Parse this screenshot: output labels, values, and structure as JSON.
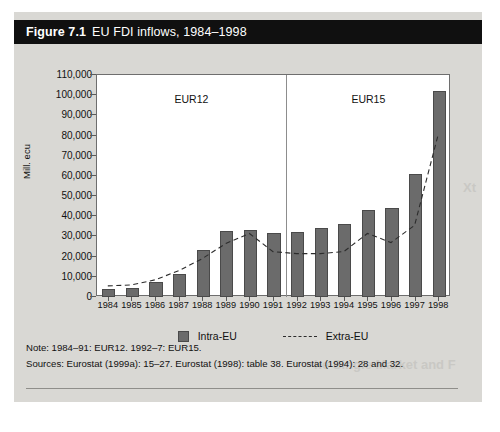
{
  "figure": {
    "number": "Figure 7.1",
    "title": "EU FDI inflows, 1984–1998"
  },
  "legend": {
    "entries": [
      {
        "label": "Intra-EU",
        "marker": "bar-swatch"
      },
      {
        "label": "Extra-EU",
        "marker": "dashed-line"
      }
    ]
  },
  "notes": {
    "note": "Note: 1984–91: EUR12. 1992–7: EUR15.",
    "sources": "Sources: Eurostat (1999a): 15–27. Eurostat (1998): table 38. Eurostat (1994): 28 and 32."
  },
  "bleed": {
    "right": "Xt",
    "heading": "he Single Market and F"
  },
  "chart_data": {
    "type": "bar",
    "title": "EU FDI inflows, 1984–1998",
    "xlabel": "",
    "ylabel": "Mill. ecu",
    "ylim": [
      0,
      110000
    ],
    "ytick_step": 10000,
    "ytick_labels": [
      "110,000",
      "100,000",
      "90,000",
      "80,000",
      "70,000",
      "60,000",
      "50,000",
      "40,000",
      "30,000",
      "20,000",
      "10,000",
      "0"
    ],
    "grid": false,
    "legend_position": "below-plot",
    "categories": [
      "1984",
      "1985",
      "1986",
      "1987",
      "1988",
      "1989",
      "1990",
      "1991",
      "1992",
      "1993",
      "1994",
      "1995",
      "1996",
      "1997",
      "1998"
    ],
    "series": [
      {
        "name": "Intra-EU",
        "type": "bar",
        "values": [
          4000,
          4500,
          7500,
          11500,
          23500,
          32500,
          33000,
          31500,
          32000,
          34000,
          36000,
          43000,
          44000,
          61000,
          102000
        ]
      },
      {
        "name": "Extra-EU",
        "type": "line",
        "style": "dashed",
        "values": [
          5000,
          5500,
          8000,
          12500,
          18500,
          26000,
          31000,
          22000,
          21000,
          21000,
          22000,
          31000,
          26500,
          35000,
          80000
        ]
      }
    ],
    "annotations": [
      {
        "text": "EUR12",
        "span": [
          "1984",
          "1991"
        ]
      },
      {
        "text": "EUR15",
        "span": [
          "1992",
          "1998"
        ]
      },
      {
        "type": "vertical-divider",
        "between": [
          "1991",
          "1992"
        ]
      }
    ]
  }
}
